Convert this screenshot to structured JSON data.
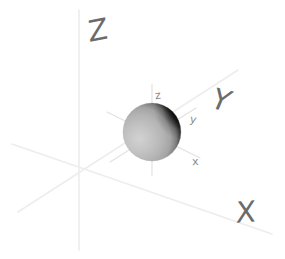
{
  "figure": {
    "background_color": "#ffffff",
    "width": 285,
    "height": 259
  },
  "world_frame": {
    "origin": {
      "x": 78,
      "y": 180
    },
    "axis_color": "#ededed",
    "label_color": "#6b6b6b",
    "axes": [
      {
        "name": "Z",
        "label": "Z",
        "direction": "up",
        "line": {
          "x1": 79,
          "y1": 250,
          "x2": 79,
          "y2": 10
        },
        "label_position": {
          "x": 88,
          "y": 16
        }
      },
      {
        "name": "Y",
        "label": "Y",
        "direction": "up-right",
        "line": {
          "x1": 18,
          "y1": 212,
          "x2": 238,
          "y2": 70
        },
        "label_position": {
          "x": 212,
          "y": 86
        }
      },
      {
        "name": "X",
        "label": "X",
        "direction": "down-right",
        "line": {
          "x1": 12,
          "y1": 144,
          "x2": 272,
          "y2": 234
        },
        "label_position": {
          "x": 236,
          "y": 198
        }
      }
    ]
  },
  "local_frame": {
    "origin": {
      "x": 152,
      "y": 132
    },
    "axis_color": "#e2e2e2",
    "label_color": "#8a8a8a",
    "axes": [
      {
        "name": "z",
        "label": "z",
        "direction": "up",
        "line": {
          "x1": 152,
          "y1": 176,
          "x2": 152,
          "y2": 84
        },
        "label_position": {
          "x": 155,
          "y": 90
        }
      },
      {
        "name": "y",
        "label": "y",
        "direction": "up-right",
        "line": {
          "x1": 110,
          "y1": 162,
          "x2": 196,
          "y2": 108
        },
        "label_position": {
          "x": 190,
          "y": 114
        }
      },
      {
        "name": "x",
        "label": "x",
        "direction": "down-right",
        "line": {
          "x1": 107,
          "y1": 112,
          "x2": 200,
          "y2": 158
        },
        "label_position": {
          "x": 192,
          "y": 156
        }
      }
    ]
  },
  "sphere": {
    "name": "shaded-sphere",
    "center": {
      "x": 152,
      "y": 132
    },
    "radius": 29,
    "lit_color": "#b9b9b9",
    "highlight_color": "#cfcfcf",
    "terminator_color": "#6e6e6e",
    "shadow_color": "#090909",
    "light_direction": "from lower-left",
    "description": "Sphere with diffuse shading, bright on the lower-left and a dark crescent shadow along the upper-right limb"
  }
}
